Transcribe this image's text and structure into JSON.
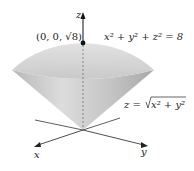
{
  "figure": {
    "point_label": "(0, 0, √8)",
    "sphere_equation": "x² + y² + z² = 8",
    "cone_equation_lhs": "z = ",
    "cone_equation_rad": "x² + y²",
    "axes": {
      "x": "x",
      "y": "y",
      "z": "z"
    }
  }
}
